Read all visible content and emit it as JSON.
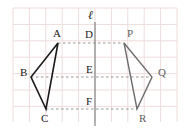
{
  "figure": {
    "width": 186,
    "height": 138,
    "background_color": "#ffffff"
  },
  "grid": {
    "visible": true,
    "line_color": "#efdcdc",
    "cell_size": 16.4,
    "x_start": 13,
    "x_end": 177,
    "y_start": 8,
    "y_end": 122,
    "columns": 10,
    "rows": 7
  },
  "mirror_line": {
    "label": "ℓ",
    "label_x": 88,
    "label_y": 19,
    "color": "#8c8c8c",
    "x": 95,
    "y_top": 22,
    "y_bottom": 126
  },
  "triangles": [
    {
      "name": "preimage",
      "stroke_color": "#1a1a1a",
      "stroke_width": 1.6,
      "label_class": "vlabel",
      "vertices": [
        {
          "label": "A",
          "x": 58,
          "y": 43,
          "label_x": 53,
          "label_y": 37
        },
        {
          "label": "B",
          "x": 31,
          "y": 77,
          "label_x": 20,
          "label_y": 76
        },
        {
          "label": "C",
          "x": 46,
          "y": 109,
          "label_x": 41,
          "label_y": 122
        }
      ]
    },
    {
      "name": "image",
      "stroke_color": "#6e6e6e",
      "stroke_width": 1.4,
      "label_class": "vlabel-gray",
      "vertices": [
        {
          "label": "P",
          "x": 124,
          "y": 43,
          "label_x": 127,
          "label_y": 37
        },
        {
          "label": "Q",
          "x": 152,
          "y": 77,
          "label_x": 158,
          "label_y": 76
        },
        {
          "label": "R",
          "x": 137,
          "y": 109,
          "label_x": 139,
          "label_y": 122
        }
      ]
    }
  ],
  "midpoints": [
    {
      "label": "D",
      "x": 95,
      "y": 43,
      "label_x": 85,
      "label_y": 38
    },
    {
      "label": "E",
      "x": 95,
      "y": 77,
      "label_x": 86,
      "label_y": 73
    },
    {
      "label": "F",
      "x": 95,
      "y": 109,
      "label_x": 86,
      "label_y": 105
    }
  ],
  "connectors": [
    {
      "name": "connector-a-p",
      "from": "A",
      "to": "P",
      "x1": 58,
      "x2": 124,
      "y": 43
    },
    {
      "name": "connector-b-q",
      "from": "B",
      "to": "Q",
      "x1": 31,
      "x2": 152,
      "y": 77
    },
    {
      "name": "connector-c-r",
      "from": "C",
      "to": "R",
      "x1": 46,
      "x2": 137,
      "y": 109
    }
  ],
  "connector_style": {
    "color": "#8a8a8a",
    "dash": "2.5,2.5",
    "width": 0.9
  }
}
